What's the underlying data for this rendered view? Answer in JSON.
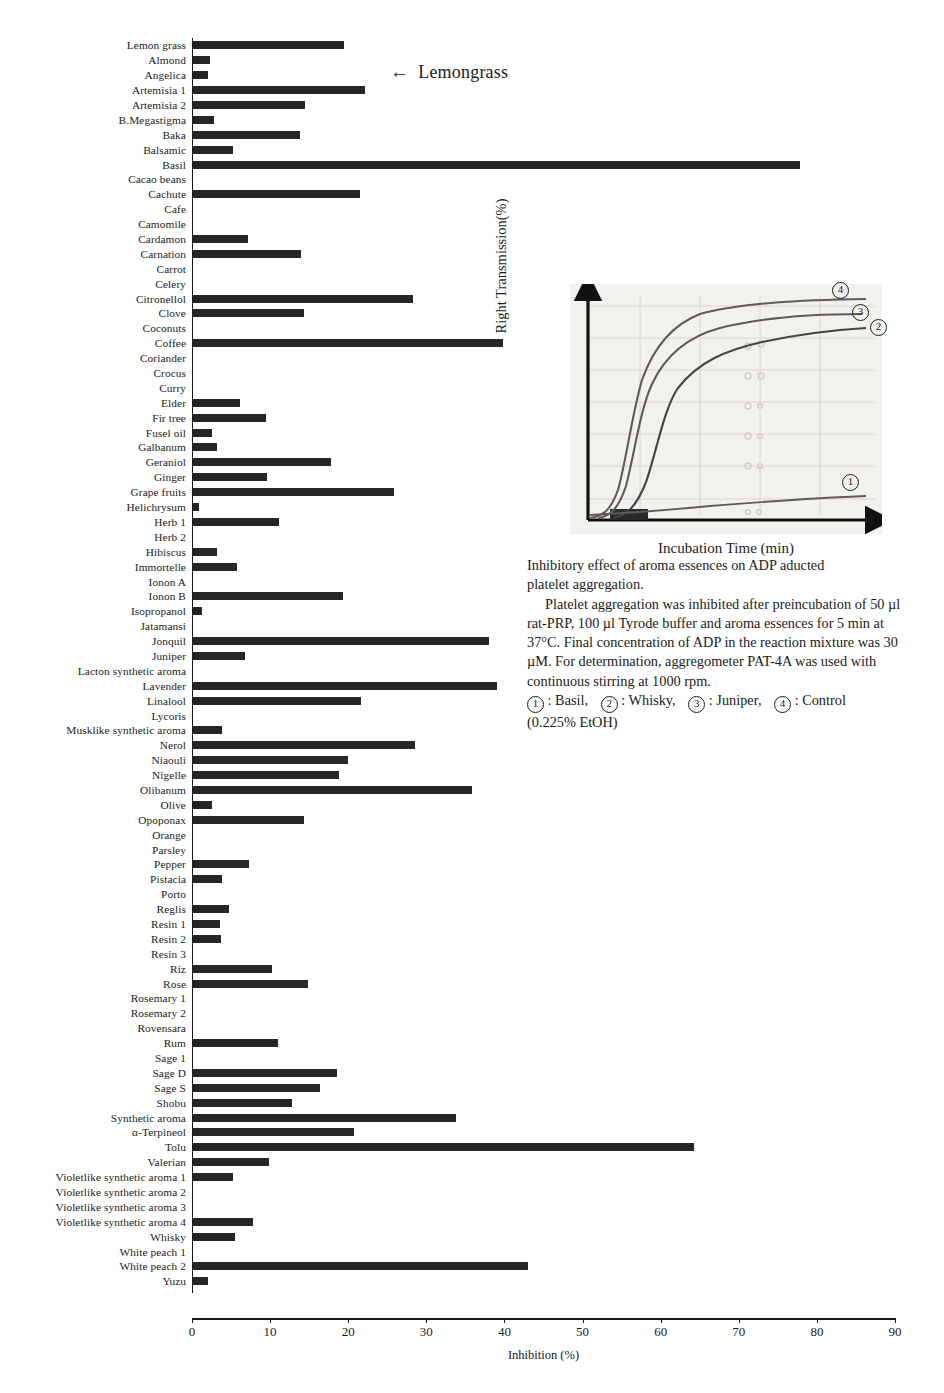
{
  "annotation": {
    "arrow": "←",
    "text": "Lemongrass"
  },
  "chart_data": {
    "type": "bar",
    "orientation": "horizontal",
    "title": "",
    "xlabel": "Inhibition (%)",
    "ylabel": "",
    "xlim": [
      0,
      90
    ],
    "xticks": [
      0,
      10,
      20,
      30,
      40,
      50,
      60,
      70,
      80,
      90
    ],
    "grid": false,
    "legend": "none",
    "bar_color": "#262626",
    "categories": [
      "Lemon grass",
      "Almond",
      "Angelica",
      "Artemisia 1",
      "Artemisia 2",
      "B.Megastigma",
      "Baka",
      "Balsamic",
      "Basil",
      "Cacao beans",
      "Cachute",
      "Cafe",
      "Camomile",
      "Cardamon",
      "Carnation",
      "Carrot",
      "Celery",
      "Citronellol",
      "Clove",
      "Coconuts",
      "Coffee",
      "Coriander",
      "Crocus",
      "Curry",
      "Elder",
      "Fir tree",
      "Fusel oil",
      "Galbanum",
      "Geraniol",
      "Ginger",
      "Grape fruits",
      "Helichrysum",
      "Herb 1",
      "Herb 2",
      "Hibiscus",
      "Immortelle",
      "Ionon A",
      "Ionon B",
      "Isopropanol",
      "Jatamansi",
      "Jonquil",
      "Juniper",
      "Lacton synthetic aroma",
      "Lavender",
      "Linalool",
      "Lycoris",
      "Musklike synthetic aroma",
      "Nerol",
      "Niaouli",
      "Nigelle",
      "Olibanum",
      "Olive",
      "Opoponax",
      "Orange",
      "Parsley",
      "Pepper",
      "Pistacia",
      "Porto",
      "Reglis",
      "Resin 1",
      "Resin 2",
      "Resin 3",
      "Riz",
      "Rose",
      "Rosemary 1",
      "Rosemary 2",
      "Rovensara",
      "Rum",
      "Sage 1",
      "Sage D",
      "Sage S",
      "Shobu",
      "Synthetic aroma",
      "α-Terpineol",
      "Tolu",
      "Valerian",
      "Violetlike synthetic aroma 1",
      "Violetlike synthetic aroma 2",
      "Violetlike synthetic aroma 3",
      "Violetlike synthetic aroma 4",
      "Whisky",
      "White peach 1",
      "White peach 2",
      "Yuzu"
    ],
    "values": [
      19.5,
      2.3,
      2.0,
      22.2,
      14.5,
      2.8,
      13.8,
      5.2,
      77.8,
      0,
      21.5,
      0,
      0,
      7.2,
      14.0,
      0,
      0,
      28.3,
      14.3,
      0,
      39.8,
      0,
      0,
      0,
      6.2,
      9.5,
      2.5,
      3.2,
      17.8,
      9.6,
      25.8,
      0.9,
      11.2,
      0,
      3.2,
      5.7,
      0,
      19.3,
      1.3,
      0,
      38.0,
      6.8,
      0,
      39.0,
      21.6,
      0,
      3.8,
      28.6,
      20.0,
      18.8,
      35.8,
      2.5,
      14.4,
      0,
      0,
      7.3,
      3.9,
      0,
      4.8,
      3.6,
      3.7,
      0,
      10.3,
      14.8,
      0,
      0,
      0,
      11.0,
      0,
      18.6,
      16.4,
      12.8,
      33.8,
      20.8,
      64.3,
      9.8,
      5.2,
      0,
      0,
      7.8,
      5.5,
      0,
      43.0,
      2.0
    ]
  },
  "inset": {
    "ylabel": "Right Transmission(%)",
    "xlabel": "Incubation Time (min)",
    "curve_labels": [
      "4",
      "3",
      "2",
      "1"
    ],
    "chart_data": {
      "type": "line",
      "xlabel": "Incubation Time (min)",
      "ylabel": "Right Transmission(%)",
      "series": [
        {
          "name": "4 Control (0.225% EtOH)",
          "x": [
            0,
            3,
            6,
            9,
            12,
            15,
            20,
            25,
            30,
            40,
            50,
            60,
            70,
            80,
            90,
            100
          ],
          "y": [
            2,
            3,
            10,
            34,
            56,
            68,
            78,
            84,
            88,
            91,
            92,
            93,
            93,
            93,
            93,
            93
          ]
        },
        {
          "name": "3 Juniper",
          "x": [
            0,
            3,
            6,
            9,
            12,
            15,
            20,
            25,
            30,
            40,
            50,
            60,
            70,
            80,
            90,
            100
          ],
          "y": [
            2,
            2,
            5,
            22,
            44,
            58,
            70,
            77,
            82,
            86,
            88,
            89,
            89,
            89,
            88,
            88
          ]
        },
        {
          "name": "2 Whisky",
          "x": [
            0,
            3,
            6,
            9,
            12,
            15,
            20,
            25,
            30,
            40,
            50,
            60,
            70,
            80,
            90,
            100
          ],
          "y": [
            2,
            2,
            3,
            10,
            28,
            44,
            58,
            67,
            74,
            80,
            83,
            84,
            85,
            85,
            85,
            85
          ]
        },
        {
          "name": "1 Basil",
          "x": [
            0,
            10,
            20,
            30,
            40,
            50,
            60,
            70,
            80,
            90,
            100
          ],
          "y": [
            2,
            3,
            5,
            7,
            8,
            9,
            10,
            11,
            11,
            12,
            12
          ]
        }
      ]
    }
  },
  "caption": {
    "line1": "Inhibitory effect of aroma essences on ADP aducted",
    "line2": "platelet aggregation.",
    "body": "Platelet aggregation was inhibited after preincubation of 50 µl rat-PRP, 100 µl Tyrode buffer and aroma essences for 5 min at 37°C. Final concentration of ADP in the reaction mixture was 30 µM. For determination, aggregometer PAT-4A was used with continuous stirring at 1000 rpm.",
    "legend": [
      {
        "num": "1",
        "name": ": Basil,"
      },
      {
        "num": "2",
        "name": ": Whisky,"
      },
      {
        "num": "3",
        "name": ": Juniper,"
      },
      {
        "num": "4",
        "name": ": Control"
      }
    ],
    "legend_tail": "(0.225% EtOH)"
  }
}
